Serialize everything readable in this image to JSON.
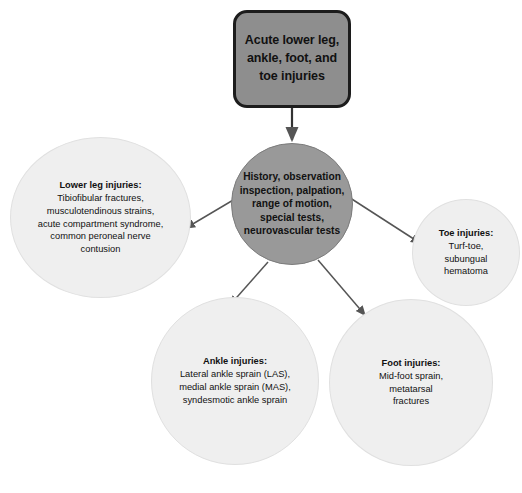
{
  "diagram": {
    "root": {
      "label": "Acute lower leg,\nankle, foot, and\ntoe injuries",
      "fill_color": "#8e8e8e",
      "border_color": "#1c1c1c"
    },
    "hub": {
      "label": "History,\nobservation\ninspection,\npalpation,\nrange of motion,\nspecial tests,\nneurovascular\ntests",
      "fill_color": "#999999"
    },
    "branches": [
      {
        "id": "lower-leg",
        "title": "Lower leg injuries:",
        "body": "Tibiofibular fractures,\nmusculotendinous strains,\nacute compartment syndrome,\ncommon peroneal nerve\ncontusion",
        "fill_color": "#efefef"
      },
      {
        "id": "toe",
        "title": "Toe injuries:",
        "body": "Turf-toe,\nsubungual\nhematoma",
        "fill_color": "#efefef"
      },
      {
        "id": "ankle",
        "title": "Ankle injuries:",
        "body": "Lateral ankle sprain (LAS),\nmedial ankle sprain (MAS),\nsyndesmotic ankle sprain",
        "fill_color": "#efefef"
      },
      {
        "id": "foot",
        "title": "Foot injuries:",
        "body": "Mid-foot sprain,\nmetatarsal\nfractures",
        "fill_color": "#efefef"
      }
    ],
    "connectors": {
      "stroke_color": "#555555",
      "edges": [
        {
          "from": "root",
          "to": "hub",
          "style": "straight-vertical-arrow"
        },
        {
          "from": "hub",
          "to": "lower-leg",
          "style": "diagonal-arrow"
        },
        {
          "from": "hub",
          "to": "toe",
          "style": "diagonal-arrow"
        },
        {
          "from": "hub",
          "to": "ankle",
          "style": "diagonal-arrow"
        },
        {
          "from": "hub",
          "to": "foot",
          "style": "diagonal-arrow"
        }
      ]
    }
  }
}
